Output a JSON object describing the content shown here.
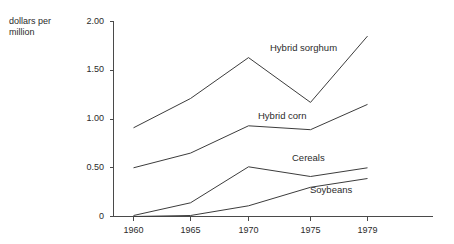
{
  "chart_data": {
    "type": "line",
    "title": "",
    "subtitle": "",
    "xlabel": "",
    "ylabel": "dollars per million",
    "ylabel_lines": [
      "dollars per",
      "million"
    ],
    "x": [
      1960,
      1965,
      1970,
      1975,
      1979
    ],
    "categories": [
      "1960",
      "1965",
      "1970",
      "1975",
      "1979"
    ],
    "xtick_labels": [
      "1960",
      "1965",
      "1970",
      "1975",
      "1979"
    ],
    "ytick_labels": [
      "0",
      "0.50",
      "1.00",
      "1.50",
      "2.00"
    ],
    "ytick_values": [
      0,
      0.5,
      1.0,
      1.5,
      2.0
    ],
    "ylim": [
      0,
      2.0
    ],
    "xlim": [
      1960,
      1979
    ],
    "grid": false,
    "legend_position": "inline-annotations",
    "series": [
      {
        "name": "Hybrid sorghum",
        "label": "Hybrid sorghum",
        "values": [
          0.91,
          1.21,
          1.63,
          1.17,
          1.85
        ],
        "color": "#3c3c3c"
      },
      {
        "name": "Hybrid corn",
        "label": "Hybrid corn",
        "values": [
          0.5,
          0.65,
          0.93,
          0.89,
          1.15
        ],
        "color": "#3c3c3c"
      },
      {
        "name": "Cereals",
        "label": "Cereals",
        "values": [
          0.01,
          0.14,
          0.51,
          0.41,
          0.5
        ],
        "color": "#3c3c3c"
      },
      {
        "name": "Soybeans",
        "label": "Soybeans",
        "values": [
          0.0,
          0.01,
          0.11,
          0.3,
          0.39
        ],
        "color": "#3c3c3c"
      }
    ],
    "annotations": [
      {
        "text": "Hybrid sorghum",
        "x": 1971.5,
        "y": 1.6
      },
      {
        "text": "Hybrid corn",
        "x": 1970.8,
        "y": 0.98
      },
      {
        "text": "Cereals",
        "x": 1973.0,
        "y": 0.56
      },
      {
        "text": "Soybeans",
        "x": 1974.2,
        "y": 0.25
      }
    ],
    "axis_color": "#4a4a4a",
    "line_color": "#3c3c3c",
    "background_color": "#ffffff"
  }
}
